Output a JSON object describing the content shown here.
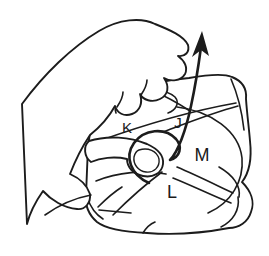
{
  "figure": {
    "labels": {
      "k": "K",
      "j": "J",
      "m": "M",
      "l": "L"
    },
    "colors": {
      "ink": "#1c1c1c",
      "paper": "#e9e7e2",
      "background": "#ffffff"
    }
  }
}
